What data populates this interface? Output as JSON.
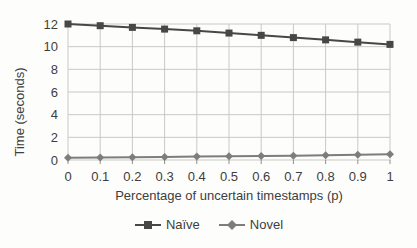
{
  "chart_data": {
    "type": "line",
    "title": "",
    "xlabel": "Percentage of uncertain timestamps (p)",
    "ylabel": "Time (seconds)",
    "x": [
      0,
      0.1,
      0.2,
      0.3,
      0.4,
      0.5,
      0.6,
      0.7,
      0.8,
      0.9,
      1
    ],
    "x_tick_labels": [
      "0",
      "0.1",
      "0.2",
      "0.3",
      "0.4",
      "0.5",
      "0.6",
      "0.7",
      "0.8",
      "0.9",
      "1"
    ],
    "y_ticks": [
      0,
      2,
      4,
      6,
      8,
      10,
      12
    ],
    "xlim": [
      0,
      1
    ],
    "ylim": [
      0,
      12
    ],
    "grid": true,
    "legend_position": "bottom",
    "series": [
      {
        "name": "Naïve",
        "marker": "square",
        "color": "#474747",
        "values": [
          12.0,
          11.85,
          11.7,
          11.55,
          11.4,
          11.2,
          11.0,
          10.8,
          10.6,
          10.4,
          10.2
        ]
      },
      {
        "name": "Novel",
        "marker": "diamond",
        "color": "#7d7d7d",
        "values": [
          0.2,
          0.22,
          0.25,
          0.27,
          0.3,
          0.32,
          0.35,
          0.38,
          0.42,
          0.46,
          0.5
        ]
      }
    ],
    "colors": {
      "grid": "#c9c9c6",
      "tick_mark": "#8f8f8c",
      "text": "#3e3e3e",
      "background": "#fdfdfb"
    }
  }
}
